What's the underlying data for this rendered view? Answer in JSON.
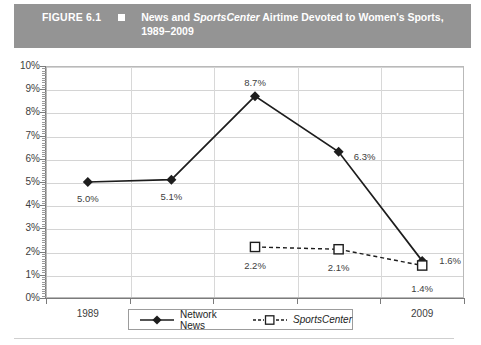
{
  "header": {
    "figure_number": "FIGURE 6.1",
    "marker_icon": "filled-square-icon",
    "title_part1": "News and ",
    "title_italic": "SportsCenter",
    "title_part2": " Airtime Devoted to Women's Sports,",
    "title_line2": "1989–2009",
    "band_color": "#949494",
    "text_color": "#ffffff"
  },
  "chart_data": {
    "type": "line",
    "xlabel": "",
    "ylabel": "",
    "categories": [
      "1989",
      "1993",
      "1999",
      "2004",
      "2009"
    ],
    "ylim": [
      0,
      10
    ],
    "ytick_labels": [
      "0%",
      "1%",
      "2%",
      "3%",
      "4%",
      "5%",
      "6%",
      "7%",
      "8%",
      "9%",
      "10%"
    ],
    "ytick_values": [
      0,
      1,
      2,
      3,
      4,
      5,
      6,
      7,
      8,
      9,
      10
    ],
    "grid": true,
    "legend_position": "bottom",
    "series": [
      {
        "name": "Network News",
        "marker": "filled-diamond",
        "line_style": "solid",
        "color": "#1d1d1d",
        "x": [
          "1989",
          "1993",
          "1999",
          "2004",
          "2009"
        ],
        "values": [
          5.0,
          5.1,
          8.7,
          6.3,
          1.6
        ],
        "data_labels": [
          "5.0%",
          "5.1%",
          "8.7%",
          "6.3%",
          "1.6%"
        ]
      },
      {
        "name": "SportsCenter",
        "marker": "open-square",
        "line_style": "dashed",
        "color": "#1d1d1d",
        "x": [
          "1999",
          "2004",
          "2009"
        ],
        "values": [
          2.2,
          2.1,
          1.4
        ],
        "data_labels": [
          "2.2%",
          "2.1%",
          "1.4%"
        ]
      }
    ]
  },
  "legend": {
    "entries": [
      {
        "label": "Network News",
        "italic": false,
        "marker_icon": "filled-diamond-icon"
      },
      {
        "label": "SportsCenter",
        "italic": true,
        "marker_icon": "open-square-icon"
      }
    ]
  }
}
